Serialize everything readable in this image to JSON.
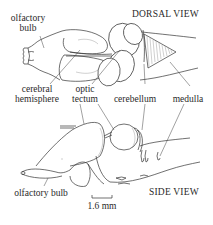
{
  "figure": {
    "dorsal_view": {
      "title": "DORSAL VIEW",
      "labels": {
        "olfactory_bulb_line1": "olfactory",
        "olfactory_bulb_line2": "bulb",
        "cerebral_hemisphere_line1": "cerebral",
        "cerebral_hemisphere_line2": "hemisphere",
        "optic_tectum_line1": "optic",
        "optic_tectum_line2": "tectum",
        "cerebellum": "cerebellum",
        "medulla": "medulla"
      }
    },
    "side_view": {
      "title": "SIDE VIEW",
      "labels": {
        "olfactory_bulb": "olfactory bulb"
      }
    },
    "scale_bar": {
      "label": "1.6 mm"
    }
  }
}
